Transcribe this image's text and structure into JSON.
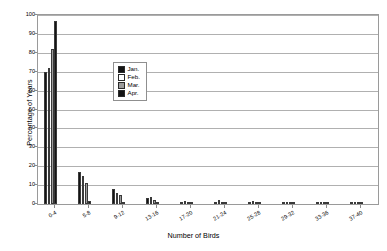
{
  "chart_data": {
    "type": "bar",
    "title": "",
    "xlabel": "Number of Birds",
    "ylabel": "Percentage of Years",
    "ylim": [
      0,
      100
    ],
    "ytick_step": 10,
    "yticks": [
      0,
      10,
      20,
      30,
      40,
      50,
      60,
      70,
      80,
      90,
      100
    ],
    "grid": "horizontal",
    "legend_position": "inside-upper-center",
    "categories": [
      "0-4",
      "5-8",
      "9-12",
      "13-16",
      "17-20",
      "21-24",
      "25-28",
      "29-32",
      "33-36",
      "37-40"
    ],
    "series": [
      {
        "name": "Jan.",
        "color": "#141414",
        "values": [
          70,
          17,
          8,
          3,
          1,
          0.5,
          1,
          0.5,
          0.5,
          0.3
        ]
      },
      {
        "name": "Feb.",
        "color": "#ffffff",
        "values": [
          72,
          15,
          6,
          3.5,
          1.5,
          2,
          1.5,
          0.5,
          0.5,
          0.8
        ]
      },
      {
        "name": "Mar.",
        "color": "#9c9c9c",
        "values": [
          82,
          11,
          5,
          2,
          1,
          0.5,
          0.5,
          0.5,
          0.5,
          0.3
        ]
      },
      {
        "name": "Apr.",
        "color": "#141414",
        "values": [
          97,
          1.5,
          1,
          0.5,
          0.3,
          0.3,
          0.3,
          0.3,
          0.2,
          0.2
        ]
      }
    ]
  },
  "legend": {
    "items": [
      {
        "label": "Jan.",
        "swatch": "#141414"
      },
      {
        "label": "Feb.",
        "swatch": "#ffffff"
      },
      {
        "label": "Mar.",
        "swatch": "#9c9c9c"
      },
      {
        "label": "Apr.",
        "swatch": "#141414"
      }
    ]
  }
}
